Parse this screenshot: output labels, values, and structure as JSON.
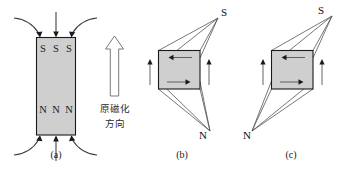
{
  "figure": {
    "background_color": "#ffffff",
    "magnet_fill_color": "#cfcfcf",
    "magnet_stroke_color": "#1a1a1a",
    "line_color": "#3a3a3a",
    "panels": [
      {
        "id": "a",
        "caption": "(a)",
        "pole_top": [
          "S",
          "S",
          "S"
        ],
        "pole_bottom": [
          "N",
          "N",
          "N"
        ],
        "shape": "vertical-rectangle",
        "annotation_lines": [
          "原磁化",
          "方向"
        ],
        "annotation_arrow": "up-hollow-arrow"
      },
      {
        "id": "b",
        "caption": "(b)",
        "pole_top": "S",
        "pole_bottom": "N",
        "shape": "square-with-skew-poles",
        "side_arrows": [
          "up",
          "up"
        ],
        "edge_arrows": [
          "left",
          "right"
        ]
      },
      {
        "id": "c",
        "caption": "(c)",
        "pole_top": "S",
        "pole_bottom": "N",
        "shape": "square-with-skew-poles",
        "side_arrows": [
          "up",
          "up"
        ],
        "edge_arrows": [
          "left",
          "right"
        ]
      }
    ],
    "captions": {
      "a": "(a)",
      "b": "(b)",
      "c": "(c)"
    },
    "annotation": {
      "line1": "原磁化",
      "line2": "方向"
    },
    "letters": {
      "s": "S",
      "n": "N",
      "s1": "S",
      "s2": "S",
      "s3": "S",
      "n1": "N",
      "n2": "N",
      "n3": "N"
    }
  }
}
